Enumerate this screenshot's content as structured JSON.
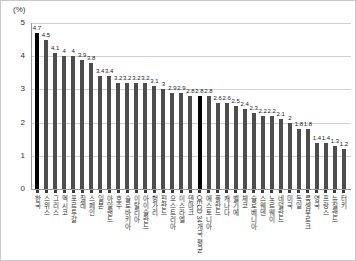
{
  "chart_data": {
    "type": "bar",
    "title": "",
    "ylabel": "(%)",
    "xlabel": "",
    "ylim": [
      0,
      5
    ],
    "yticks": [
      0,
      1,
      2,
      3,
      4,
      5
    ],
    "grid": "horizontal",
    "legend": "none",
    "bar_color": "#4d4d4d",
    "highlight_color": "#000000",
    "highlight_indices": [
      0,
      18
    ],
    "categories": [
      "한국",
      "스위스",
      "그리스",
      "멕시코",
      "포르투갈",
      "칠레",
      "스페인",
      "일본",
      "아일랜드",
      "호주",
      "슬로바키아",
      "이탈리아",
      "아이슬란드",
      "헝가리",
      "핀란드",
      "오스트리아",
      "이스라엘",
      "덴마크",
      "OECD 34개국 평균",
      "에스토니아",
      "폴란드",
      "캐나다",
      "벨기에",
      "체코",
      "슬로베니아",
      "스웨덴",
      "노르웨이",
      "네덜란드",
      "미국",
      "독일",
      "룩셈부르크",
      "영국",
      "프랑스",
      "뉴질랜드",
      "터키"
    ],
    "values": [
      4.7,
      4.5,
      4.1,
      4.0,
      4.0,
      3.9,
      3.8,
      3.4,
      3.4,
      3.2,
      3.2,
      3.2,
      3.2,
      3.1,
      3.0,
      2.9,
      2.9,
      2.8,
      2.8,
      2.8,
      2.6,
      2.6,
      2.5,
      2.4,
      2.3,
      2.2,
      2.2,
      2.1,
      2.0,
      1.8,
      1.8,
      1.4,
      1.4,
      1.3,
      1.2
    ]
  }
}
